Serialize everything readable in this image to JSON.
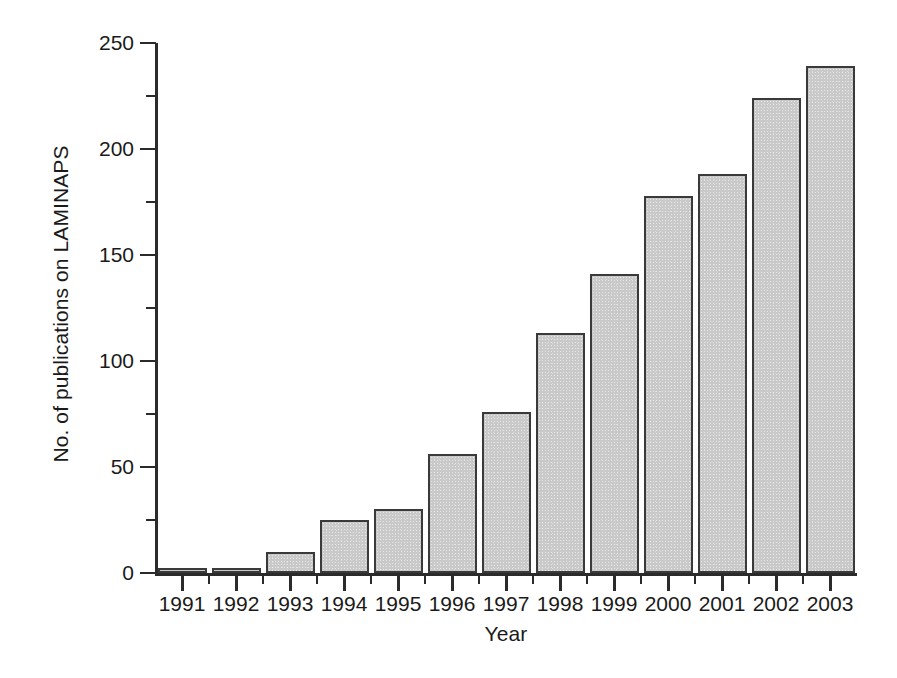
{
  "chart_data": {
    "type": "bar",
    "title": "",
    "xlabel": "Year",
    "ylabel": "No. of publications on LAMINAPS",
    "categories": [
      "1991",
      "1992",
      "1993",
      "1994",
      "1995",
      "1996",
      "1997",
      "1998",
      "1999",
      "2000",
      "2001",
      "2002",
      "2003"
    ],
    "values": [
      2,
      2,
      10,
      25,
      30,
      56,
      76,
      113,
      141,
      178,
      188,
      224,
      239
    ],
    "ylim": [
      0,
      250
    ],
    "ytick_major": [
      0,
      50,
      100,
      150,
      200,
      250
    ],
    "ytick_minor": [
      25,
      75,
      125,
      175,
      225
    ],
    "grid": false,
    "legend": false,
    "legend_position": "none",
    "series": [
      {
        "name": "No. of publications on LAMINAPS",
        "values": [
          2,
          2,
          10,
          25,
          30,
          56,
          76,
          113,
          141,
          178,
          188,
          224,
          239
        ]
      }
    ],
    "bar_fill_color": "#c9c9c9",
    "bar_edge_color": "#3a3a3a",
    "axis_color": "#2b2b2b",
    "background_color": "#ffffff"
  },
  "axes": {
    "y_title": "No. of publications on LAMINAPS",
    "x_title": "Year",
    "y_labels": [
      "250",
      "200",
      "150",
      "100",
      "50",
      "0"
    ],
    "x_labels": [
      "1991",
      "1992",
      "1993",
      "1994",
      "1995",
      "1996",
      "1997",
      "1998",
      "1999",
      "2000",
      "2001",
      "2002",
      "2003"
    ]
  }
}
